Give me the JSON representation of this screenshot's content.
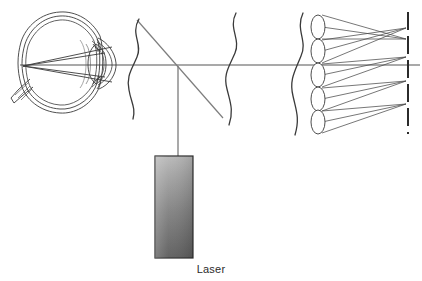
{
  "figure": {
    "background_color": "#ffffff",
    "line_color": "#3a3a3a",
    "beam_color": "#9a9a9a",
    "eye_line_color": "#404040"
  },
  "labels": {
    "laser": {
      "text": "Laser",
      "x": 173,
      "y": 272,
      "font_size": 11,
      "color": "#2b2b2b"
    }
  },
  "components": {
    "eye": {
      "name": "human eye cross-section",
      "center_x": 62,
      "center_y": 62,
      "radius_x": 40,
      "radius_y": 48,
      "retina_focus_x": 23,
      "retina_focus_y": 66,
      "optic_nerve_x": 20,
      "optic_nerve_y": 98,
      "outline_color": "#3b3b3b"
    },
    "beamsplitter": {
      "name": "beamsplitter",
      "x1": 137,
      "y1": 20,
      "x2": 223,
      "y2": 118,
      "color": "#787878"
    },
    "horizontal_beam": {
      "name": "horizontal optical axis beam",
      "x1": 20,
      "y1": 65,
      "x2": 420,
      "y2": 65,
      "color": "#a6a6a6",
      "width": 2
    },
    "vertical_beam": {
      "name": "laser beam to beamsplitter",
      "x": 178,
      "y1": 65,
      "y2": 156,
      "color": "#a6a6a6",
      "width": 2
    },
    "laser_box": {
      "name": "laser source housing",
      "x": 155,
      "y": 156,
      "width": 38,
      "height": 102,
      "gradient_top": "#b4b4b4",
      "gradient_bottom": "#5e5e5e",
      "border_color": "#2e2e2e"
    },
    "wavefronts": [
      {
        "id": "wavefront-1",
        "name": "aberrated wavefront near eye",
        "x": 135,
        "y_top": 20,
        "y_bottom": 118,
        "amplitude": 9
      },
      {
        "id": "wavefront-2",
        "name": "aberrated wavefront after beamsplitter",
        "x": 234,
        "y_top": 14,
        "y_bottom": 124,
        "amplitude": 10
      },
      {
        "id": "wavefront-3",
        "name": "aberrated wavefront at lenslet array",
        "x": 300,
        "y_top": 14,
        "y_bottom": 134,
        "amplitude": 9
      }
    ],
    "lenslet_array": {
      "name": "lenslet array",
      "count": 5,
      "center_x": 318,
      "ellipse_rx": 7,
      "ellipse_ry": 12,
      "centers_y": [
        27,
        51,
        75,
        99,
        122
      ]
    },
    "detector": {
      "name": "CCD detector array",
      "x": 408,
      "y_top": 12,
      "y_bottom": 134,
      "dash_pattern": "18 6",
      "color": "#2b2b2b",
      "width": 2
    },
    "ray_cones": [
      {
        "id": "cone-1",
        "lenslet_y": 27,
        "focus_y": 39
      },
      {
        "id": "cone-2",
        "lenslet_y": 51,
        "focus_y": 28
      },
      {
        "id": "cone-3",
        "lenslet_y": 75,
        "focus_y": 57
      },
      {
        "id": "cone-4",
        "lenslet_y": 99,
        "focus_y": 81
      },
      {
        "id": "cone-5",
        "lenslet_y": 122,
        "focus_y": 104
      }
    ]
  }
}
